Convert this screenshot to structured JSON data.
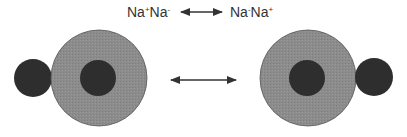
{
  "equation": {
    "left": {
      "a": "Na",
      "a_charge": "+",
      "b": "Na",
      "b_charge": "-"
    },
    "right": {
      "a": "Na",
      "a_charge": "-",
      "b": "Na",
      "b_charge": "+"
    },
    "arrow": "double-headed-arrow"
  },
  "diagram": {
    "left_structure": {
      "small_atom": "small-dark-sphere",
      "large_atom": "large-gray-sphere-with-dark-core"
    },
    "right_structure": {
      "large_atom": "large-gray-sphere-with-dark-core",
      "small_atom": "small-dark-sphere"
    },
    "middle_arrow": "double-headed-arrow"
  },
  "colors": {
    "outer": "#8c8c8c",
    "core": "#2e2e2e",
    "arrow": "#333333"
  }
}
